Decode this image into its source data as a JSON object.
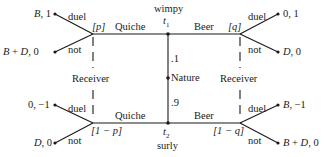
{
  "diagram": {
    "type": "game-tree",
    "nature": {
      "label": "Nature"
    },
    "types": {
      "top": {
        "name": "wimpy",
        "node": "t",
        "sub": "1",
        "prob": ".1"
      },
      "bottom": {
        "name": "surly",
        "node": "t",
        "sub": "2",
        "prob": ".9"
      }
    },
    "actions": {
      "quiche": "Quiche",
      "beer": "Beer",
      "duel": "duel",
      "not": "not"
    },
    "receiver_label": "Receiver",
    "beliefs": {
      "top_left": "[p]",
      "top_right": "[q]",
      "bottom_left": "[1 − p]",
      "bottom_right": "[1 − q]"
    },
    "payoffs": {
      "top_left_duel": "B, 1",
      "top_left_not": "B + D, 0",
      "top_right_duel": "0, 1",
      "top_right_not": "D, 0",
      "bottom_left_duel": "0, −1",
      "bottom_left_not": "D, 0",
      "bottom_right_duel": "B, −1",
      "bottom_right_not": "B + D, 0"
    }
  }
}
